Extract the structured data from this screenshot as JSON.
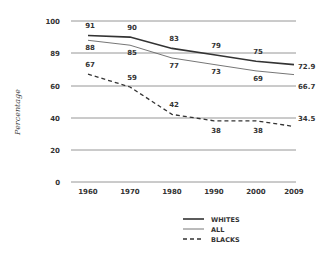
{
  "chart_data": {
    "type": "line",
    "title": "",
    "xlabel": "",
    "ylabel": "Percentage",
    "x": [
      "1960",
      "1970",
      "1980",
      "1990",
      "2000",
      "2009"
    ],
    "y_ticks": [
      "100",
      "89",
      "60",
      "40",
      "20",
      "0"
    ],
    "ylim": [
      0,
      100
    ],
    "grid": true,
    "legend_position": "bottom-right",
    "series": [
      {
        "name": "WHITES",
        "style": "solid-thick",
        "color": "#333333",
        "values": [
          91,
          90,
          83,
          79,
          75,
          72.9
        ],
        "labels": [
          "91",
          "90",
          "83",
          "79",
          "75",
          "72.9"
        ]
      },
      {
        "name": "ALL",
        "style": "solid-thin",
        "color": "#666666",
        "values": [
          88,
          85,
          77,
          73,
          69,
          66.7
        ],
        "labels": [
          "88",
          "85",
          "77",
          "73",
          "69",
          "66.7"
        ]
      },
      {
        "name": "BLACKS",
        "style": "dashed",
        "color": "#333333",
        "values": [
          67,
          59,
          42,
          38,
          38,
          34.5
        ],
        "labels": [
          "67",
          "59",
          "42",
          "38",
          "38",
          "34.5"
        ]
      }
    ]
  },
  "legend": {
    "items": [
      {
        "label": "WHITES"
      },
      {
        "label": "ALL"
      },
      {
        "label": "BLACKS"
      }
    ]
  }
}
